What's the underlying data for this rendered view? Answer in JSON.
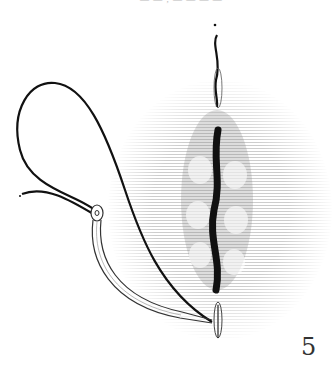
{
  "figure": {
    "number": "5",
    "top_cutoff_text": "— — , — — — —"
  },
  "colors": {
    "ink": "#1a1a1a",
    "hatching": "#9a9a9a",
    "background": "#ffffff"
  }
}
